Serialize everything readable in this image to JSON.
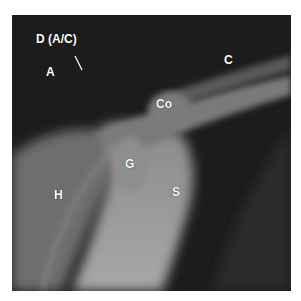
{
  "figure": {
    "labels": [
      {
        "id": "d-ac",
        "text": "D (A/C)",
        "x": 48,
        "y": 33
      },
      {
        "id": "a",
        "text": "A",
        "x": 46,
        "y": 66
      },
      {
        "id": "c",
        "text": "C",
        "x": 226,
        "y": 54
      },
      {
        "id": "co",
        "text": "Co",
        "x": 156,
        "y": 98
      },
      {
        "id": "g",
        "text": "G",
        "x": 124,
        "y": 158
      },
      {
        "id": "h",
        "text": "H",
        "x": 54,
        "y": 189
      },
      {
        "id": "s",
        "text": "S",
        "x": 172,
        "y": 186
      }
    ]
  }
}
